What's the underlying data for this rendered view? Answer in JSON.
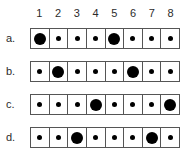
{
  "figure": {
    "columns": [
      "1",
      "2",
      "3",
      "4",
      "5",
      "6",
      "7",
      "8"
    ],
    "colors": {
      "dot": "#000000",
      "cell_border": "#555555",
      "cell_background": "#ffffff",
      "text": "#2b2b2b",
      "page_background": "#ffffff"
    },
    "rows": [
      {
        "label": "a.",
        "cells": [
          "large",
          "small",
          "small",
          "small",
          "large",
          "small",
          "small",
          "small"
        ]
      },
      {
        "label": "b.",
        "cells": [
          "small",
          "large",
          "small",
          "small",
          "small",
          "large",
          "small",
          "small"
        ]
      },
      {
        "label": "c.",
        "cells": [
          "small",
          "small",
          "small",
          "large",
          "small",
          "small",
          "small",
          "large"
        ]
      },
      {
        "label": "d.",
        "cells": [
          "small",
          "small",
          "large",
          "small",
          "small",
          "small",
          "large",
          "small"
        ]
      }
    ]
  }
}
